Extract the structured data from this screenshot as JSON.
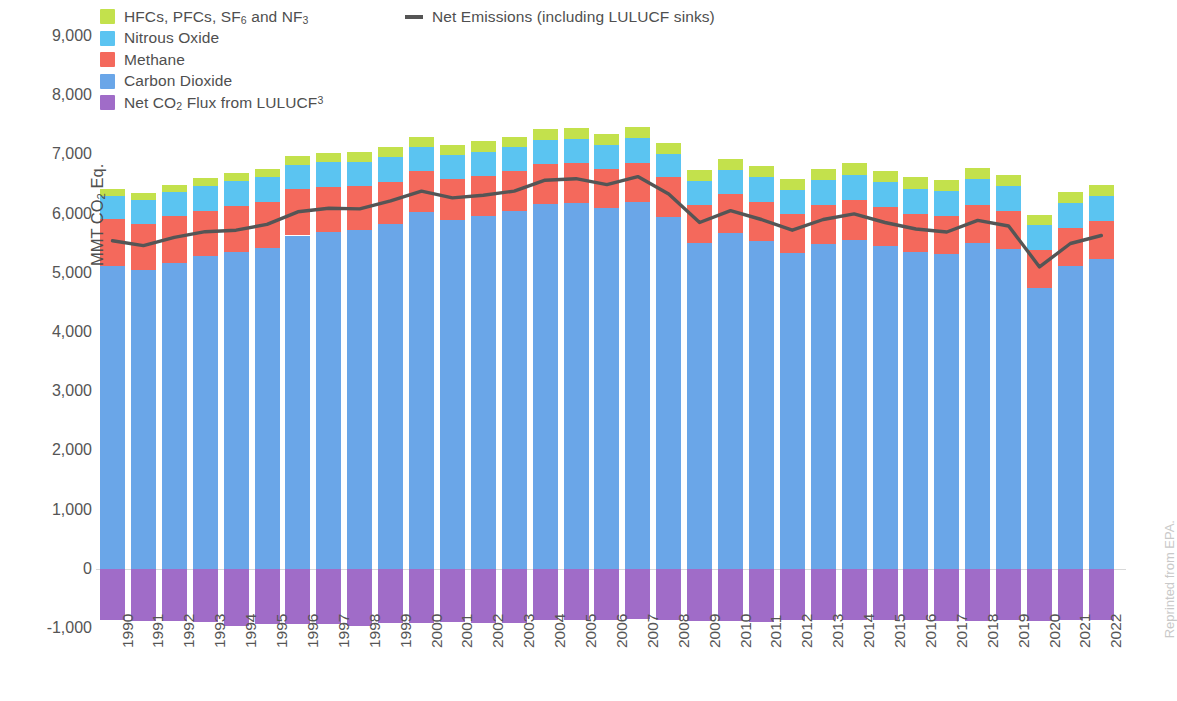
{
  "legend": {
    "series": [
      {
        "label": "HFCs, PFCs, SF₆ and NF₃",
        "color": "#c3e14c",
        "key": "fgases"
      },
      {
        "label": "Nitrous Oxide",
        "color": "#5bc4f1",
        "key": "n2o"
      },
      {
        "label": "Methane",
        "color": "#f4695c",
        "key": "ch4"
      },
      {
        "label": "Carbon Dioxide",
        "color": "#6aa6e8",
        "key": "co2"
      },
      {
        "label": "Net CO₂ Flux from LULUCF³",
        "color": "#a06cc8",
        "key": "lulucf"
      }
    ],
    "line": {
      "label": "Net Emissions (including LULUCF sinks)",
      "color": "#555555"
    }
  },
  "axis": {
    "y_title": "MMT CO₂ Eq.",
    "y_ticks": [
      "9,000",
      "8,000",
      "7,000",
      "6,000",
      "5,000",
      "4,000",
      "3,000",
      "2,000",
      "1,000",
      "0",
      "-1,000"
    ],
    "y_min": -1000,
    "y_max": 9000,
    "y_step": 1000
  },
  "credit": "Reprinted from EPA.",
  "chart_data": {
    "type": "bar",
    "title": "",
    "subtitle": "",
    "xlabel": "",
    "ylabel": "MMT CO₂ Eq.",
    "ylim": [
      -1000,
      9000
    ],
    "grid": false,
    "legend_position": "top-left",
    "stacked": true,
    "categories": [
      "1990",
      "1991",
      "1992",
      "1993",
      "1994",
      "1995",
      "1996",
      "1997",
      "1998",
      "1999",
      "2000",
      "2001",
      "2002",
      "2003",
      "2004",
      "2005",
      "2006",
      "2007",
      "2008",
      "2009",
      "2010",
      "2011",
      "2012",
      "2013",
      "2014",
      "2015",
      "2016",
      "2017",
      "2018",
      "2019",
      "2020",
      "2021",
      "2022"
    ],
    "series": [
      {
        "name": "Carbon Dioxide",
        "color": "#6aa6e8",
        "values": [
          5120,
          5050,
          5170,
          5290,
          5350,
          5420,
          5630,
          5690,
          5730,
          5820,
          6020,
          5900,
          5960,
          6040,
          6160,
          6180,
          6090,
          6190,
          5950,
          5500,
          5680,
          5540,
          5340,
          5480,
          5560,
          5450,
          5350,
          5310,
          5500,
          5400,
          4740,
          5110,
          5230
        ]
      },
      {
        "name": "Methane",
        "color": "#f4695c",
        "values": [
          790,
          780,
          790,
          760,
          770,
          780,
          780,
          760,
          730,
          720,
          700,
          690,
          680,
          680,
          670,
          670,
          670,
          670,
          660,
          650,
          650,
          660,
          660,
          670,
          670,
          660,
          650,
          650,
          650,
          650,
          640,
          650,
          650
        ]
      },
      {
        "name": "Nitrous Oxide",
        "color": "#5bc4f1",
        "values": [
          390,
          400,
          410,
          420,
          430,
          410,
          410,
          420,
          410,
          410,
          400,
          400,
          400,
          400,
          410,
          410,
          400,
          410,
          400,
          400,
          410,
          410,
          400,
          420,
          430,
          420,
          420,
          420,
          430,
          420,
          420,
          420,
          420
        ]
      },
      {
        "name": "HFCs, PFCs, SF₆ and NF₃",
        "color": "#c3e14c",
        "values": [
          110,
          110,
          120,
          125,
          130,
          140,
          150,
          160,
          170,
          175,
          180,
          175,
          180,
          180,
          185,
          190,
          190,
          195,
          190,
          180,
          190,
          190,
          190,
          190,
          195,
          190,
          190,
          190,
          195,
          190,
          180,
          185,
          190
        ]
      },
      {
        "name": "Net CO₂ Flux from LULUCF³",
        "color": "#a06cc8",
        "values": [
          -870,
          -880,
          -890,
          -900,
          -960,
          -930,
          -940,
          -940,
          -960,
          -910,
          -920,
          -900,
          -910,
          -920,
          -860,
          -860,
          -860,
          -840,
          -870,
          -880,
          -880,
          -900,
          -870,
          -860,
          -860,
          -870,
          -870,
          -880,
          -890,
          -870,
          -880,
          -870,
          -860
        ]
      }
    ],
    "line_series": {
      "name": "Net Emissions (including LULUCF sinks)",
      "color": "#555555",
      "values": [
        5540,
        5460,
        5600,
        5695,
        5720,
        5820,
        6030,
        6090,
        6080,
        6215,
        6380,
        6265,
        6310,
        6380,
        6565,
        6590,
        6490,
        6625,
        6330,
        5850,
        6050,
        5900,
        5720,
        5900,
        5995,
        5850,
        5740,
        5690,
        5885,
        5790,
        5100,
        5495,
        5630
      ]
    }
  }
}
